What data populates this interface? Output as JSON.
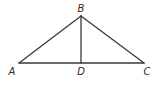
{
  "diagram": {
    "type": "triangle-with-altitude",
    "points": {
      "A": {
        "x": 19,
        "y": 63,
        "label": "A",
        "label_x": 12,
        "label_y": 75
      },
      "B": {
        "x": 81,
        "y": 16,
        "label": "B",
        "label_x": 81,
        "label_y": 12
      },
      "C": {
        "x": 144,
        "y": 63,
        "label": "C",
        "label_x": 147,
        "label_y": 75
      },
      "D": {
        "x": 81,
        "y": 63,
        "label": "D",
        "label_x": 81,
        "label_y": 75
      }
    },
    "segments": [
      {
        "name": "AB",
        "from": "A",
        "to": "B"
      },
      {
        "name": "BC",
        "from": "B",
        "to": "C"
      },
      {
        "name": "AC",
        "from": "A",
        "to": "C"
      },
      {
        "name": "BD",
        "from": "B",
        "to": "D"
      }
    ],
    "line_color": "#3a3a3a",
    "label_color": "#2a2a2a",
    "background": "#ffffff"
  }
}
